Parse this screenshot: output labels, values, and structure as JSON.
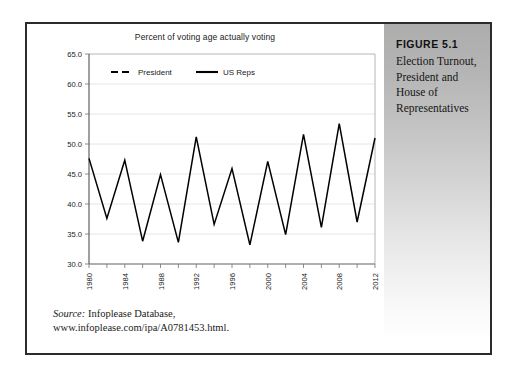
{
  "figure": {
    "number": "FIGURE 5.1",
    "caption": "Election Turnout, President and House of Representatives"
  },
  "source": {
    "label": "Source:",
    "line1": " Infoplease Database,",
    "line2": "www.infoplease.com/ipa/A0781453.html."
  },
  "colors": {
    "line": "#000000",
    "grid": "#e0e0e0",
    "axis": "#808080",
    "text": "#1a1a1a",
    "panel_top": "#adadad",
    "panel_bottom": "#ffffff",
    "frame": "#2b2b2b"
  },
  "chart_data": {
    "type": "line",
    "title": "Percent of voting age actually voting",
    "xlabel": "",
    "ylabel": "",
    "ylim": [
      30.0,
      65.0
    ],
    "ytick_step": 5.0,
    "yticks": [
      "30.0",
      "35.0",
      "40.0",
      "45.0",
      "50.0",
      "55.0",
      "60.0",
      "65.0"
    ],
    "ytick_values": [
      30.0,
      35.0,
      40.0,
      45.0,
      50.0,
      55.0,
      60.0,
      65.0
    ],
    "grid": true,
    "legend_position": "top-left-inside",
    "x": [
      1980,
      1982,
      1984,
      1986,
      1988,
      1990,
      1992,
      1994,
      1996,
      1998,
      2000,
      2002,
      2004,
      2006,
      2008,
      2010,
      2012
    ],
    "xtick_labels": [
      "1980",
      "",
      "1984",
      "",
      "1988",
      "",
      "1992",
      "",
      "1996",
      "",
      "2000",
      "",
      "2004",
      "",
      "2008",
      "",
      "2012"
    ],
    "xtick_labels_shown": [
      "1980",
      "1984",
      "1988",
      "1992",
      "1996",
      "2000",
      "2004",
      "2008",
      "2012"
    ],
    "xtick_rotation": -90,
    "series": [
      {
        "name": "President",
        "style": "dashed",
        "values": [
          52.8,
          null,
          53.3,
          null,
          50.4,
          null,
          55.1,
          null,
          49.2,
          null,
          61.5,
          null,
          55.9,
          null,
          57.0,
          null,
          53.8
        ]
      },
      {
        "name": "US Reps",
        "style": "solid",
        "values": [
          47.6,
          37.6,
          47.3,
          33.8,
          44.9,
          33.6,
          51.2,
          36.6,
          45.9,
          33.2,
          47.1,
          34.9,
          51.6,
          36.1,
          53.4,
          37.0,
          51.0
        ]
      }
    ]
  }
}
